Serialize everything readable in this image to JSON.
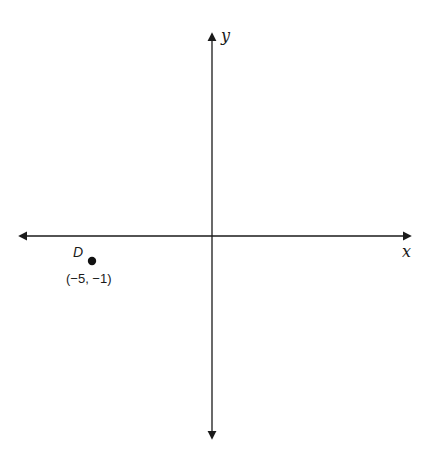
{
  "diagram": {
    "type": "coordinate-plane",
    "axes": {
      "x_label": "x",
      "y_label": "y",
      "color": "#1a1a1a"
    },
    "points": [
      {
        "name": "D",
        "coordinates": "(−5, −1)",
        "x": -5,
        "y": -1
      }
    ]
  }
}
